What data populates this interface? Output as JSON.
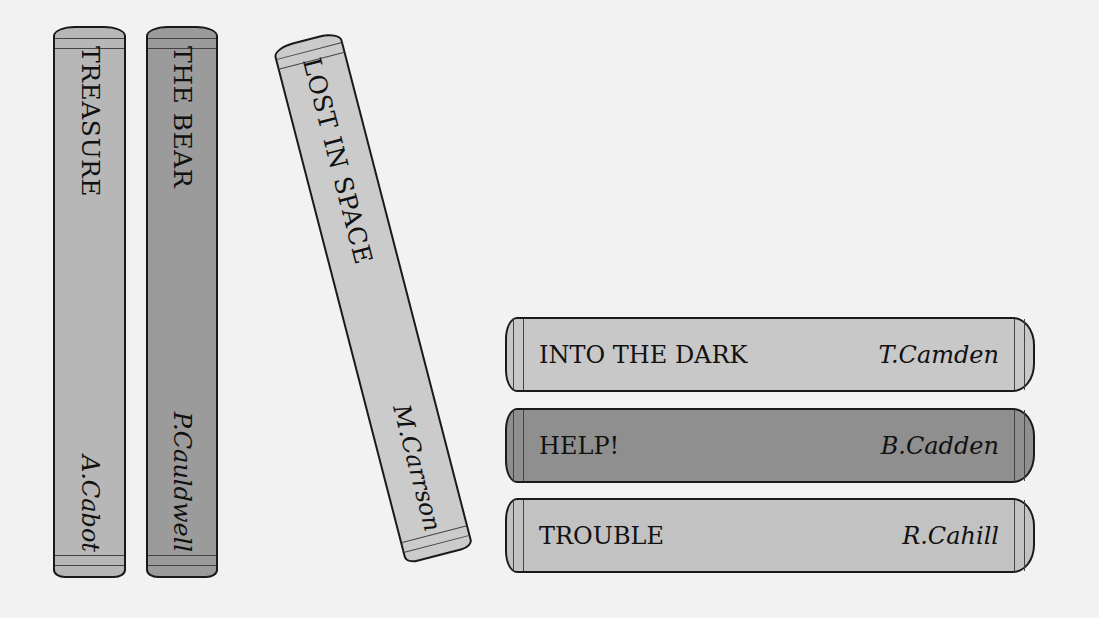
{
  "colors": {
    "background": "#f2f2f2",
    "light_gray": "#c4c4c4",
    "medium_gray": "#a6a6a6",
    "dark_gray": "#8e8e8e",
    "outline": "#1a1a1a"
  },
  "standing_books": [
    {
      "title": "TREASURE",
      "author": "A.Cabot",
      "color": "#b7b7b7"
    },
    {
      "title": "THE BEAR",
      "author": "P.Cauldwell",
      "color": "#9b9b9b"
    },
    {
      "title": "LOST IN SPACE",
      "author": "M.Carrson",
      "color": "#cbcbcb",
      "tilted": true
    }
  ],
  "stacked_books": [
    {
      "title": "INTO THE DARK",
      "author": "T.Camden",
      "color": "#c8c8c8"
    },
    {
      "title": "HELP!",
      "author": "B.Cadden",
      "color": "#8f8f8f"
    },
    {
      "title": "TROUBLE",
      "author": "R.Cahill",
      "color": "#c2c2c2"
    }
  ]
}
